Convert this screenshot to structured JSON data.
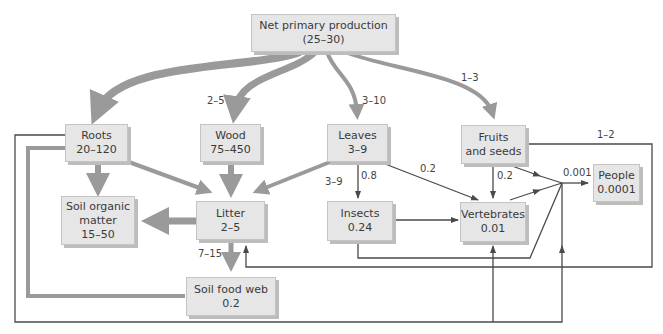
{
  "diagram": {
    "nodes": {
      "npp": {
        "line1": "Net primary production",
        "line2": "(25–30)"
      },
      "roots": {
        "line1": "Roots",
        "line2": "20–120"
      },
      "wood": {
        "line1": "Wood",
        "line2": "75–450"
      },
      "leaves": {
        "line1": "Leaves",
        "line2": "3–9"
      },
      "fruits": {
        "line1": "Fruits",
        "line2": "and seeds"
      },
      "people": {
        "line1": "People",
        "line2": "0.0001"
      },
      "som": {
        "line1": "Soil organic",
        "line2": "matter",
        "line3": "15–50"
      },
      "litter": {
        "line1": "Litter",
        "line2": "2–5"
      },
      "insects": {
        "line1": "Insects",
        "line2": "0.24"
      },
      "vertebrates": {
        "line1": "Vertebrates",
        "line2": "0.01"
      },
      "sfw": {
        "line1": "Soil food web",
        "line2": "0.2"
      }
    },
    "labels": {
      "wood_flow": "2–5",
      "leaves_flow": "3–10",
      "fruits_flow": "1–3",
      "fruits_people": "1–2",
      "leaves_litter": "3–9",
      "leaves_insects": "0.8",
      "leaves_vertebrates": "0.2",
      "fruits_vertebrates": "0.2",
      "to_people": "0.001",
      "litter_sfw": "7–15"
    },
    "colors": {
      "thick_arrow": "#9a9a9a",
      "thin_arrow": "#4a4a4a",
      "box_fill": "#e6e6e6"
    }
  }
}
